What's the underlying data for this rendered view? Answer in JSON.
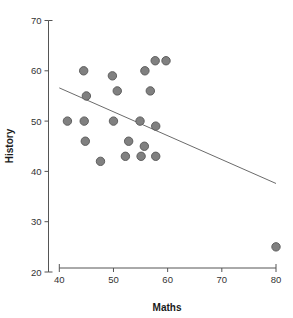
{
  "chart_data": {
    "type": "scatter",
    "title": "",
    "xlabel": "Maths",
    "ylabel": "History",
    "xlim": [
      40,
      80
    ],
    "ylim": [
      20,
      70
    ],
    "xticks": [
      40,
      50,
      60,
      70,
      80
    ],
    "yticks": [
      20,
      30,
      40,
      50,
      60,
      70
    ],
    "grid": false,
    "legend": "none",
    "marker_color": "#808080",
    "marker_edge_color": "#5e5e5e",
    "line_color": "#6b6b6b",
    "axis_color": "#555555",
    "points": [
      {
        "x": 41.5,
        "y": 50
      },
      {
        "x": 44.5,
        "y": 60
      },
      {
        "x": 44.6,
        "y": 50
      },
      {
        "x": 45.0,
        "y": 55
      },
      {
        "x": 44.8,
        "y": 46
      },
      {
        "x": 47.6,
        "y": 42
      },
      {
        "x": 49.8,
        "y": 59
      },
      {
        "x": 50.0,
        "y": 50
      },
      {
        "x": 50.7,
        "y": 56
      },
      {
        "x": 52.2,
        "y": 43
      },
      {
        "x": 52.8,
        "y": 46
      },
      {
        "x": 54.9,
        "y": 50
      },
      {
        "x": 55.1,
        "y": 43
      },
      {
        "x": 55.7,
        "y": 45
      },
      {
        "x": 55.8,
        "y": 60
      },
      {
        "x": 56.8,
        "y": 56
      },
      {
        "x": 57.7,
        "y": 62
      },
      {
        "x": 57.8,
        "y": 49
      },
      {
        "x": 57.8,
        "y": 43
      },
      {
        "x": 59.7,
        "y": 62
      },
      {
        "x": 80.0,
        "y": 25
      }
    ],
    "trend_line": {
      "x_start": 40,
      "y_start": 56.6,
      "x_end": 80,
      "y_end": 37.6
    }
  }
}
